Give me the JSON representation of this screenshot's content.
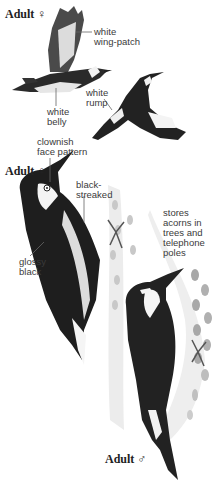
{
  "figure": {
    "headings": [
      {
        "text": "Adult",
        "symbol": "♀"
      },
      {
        "text": "Adult",
        "symbol": "♀"
      },
      {
        "text": "Adult",
        "symbol": "♂"
      }
    ],
    "callouts": {
      "wing_patch": "white\nwing-patch",
      "belly": "white\nbelly",
      "rump": "white\nrump",
      "face": "clownish\nface pattern",
      "streaked": "black-\nstreaked",
      "glossy": "glossy\nblack",
      "behavior": "stores\nacorns in\ntrees and\ntelephone\npoles"
    },
    "colors": {
      "background": "#ffffff",
      "ink": "#1e1e1e",
      "label": "#3a3a3a",
      "trunk": "#e4e4e4",
      "acorn": "#bdbdbd"
    }
  }
}
